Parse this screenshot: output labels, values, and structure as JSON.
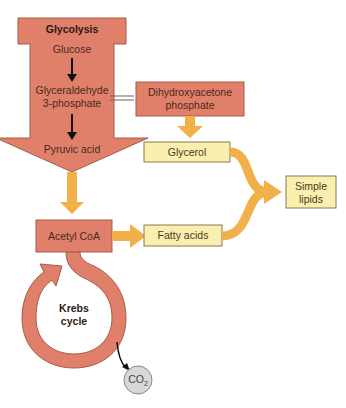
{
  "diagram": {
    "glycolysis": {
      "title": "Glycolysis",
      "steps": [
        "Glucose",
        "Glyceraldehyde",
        "3-phosphate",
        "Pyruvic acid"
      ]
    },
    "dhap": {
      "line1": "Dihydroxyacetone",
      "line2": "phosphate"
    },
    "glycerol": "Glycerol",
    "simple_lipids": {
      "line1": "Simple",
      "line2": "lipids"
    },
    "acetyl_coa": "Acetyl CoA",
    "fatty_acids": "Fatty acids",
    "krebs": {
      "line1": "Krebs",
      "line2": "cycle"
    },
    "co2": {
      "main": "CO",
      "sub": "2"
    },
    "colors": {
      "salmon": "#e0806a",
      "salmon_border": "#a85a48",
      "yellow_box": "#fbefb0",
      "orange_arrow": "#f2b04a",
      "co2_fill": "#d8d8d8"
    }
  }
}
